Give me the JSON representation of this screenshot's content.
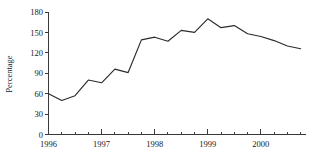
{
  "chart_data": {
    "type": "line",
    "title": "",
    "subtitle": "",
    "xlabel": "",
    "ylabel": "Percentage",
    "ylim": [
      0,
      180
    ],
    "yticks": [
      0,
      30,
      60,
      90,
      120,
      150,
      180
    ],
    "ytick_labels": [
      "0",
      "30",
      "60",
      "90",
      "120",
      "150",
      "180"
    ],
    "xlim": [
      1996.0,
      2000.85
    ],
    "xticks": [
      1996,
      1997,
      1998,
      1999,
      2000
    ],
    "xtick_labels": [
      "1996",
      "1997",
      "1998",
      "1999",
      "2000"
    ],
    "minor_xticks_per_year": 4,
    "grid": false,
    "legend": false,
    "legend_position": "none",
    "line_color": "#2b2b2b",
    "axis_color": "#3a3a3a",
    "background_color": "#ffffff",
    "series": [
      {
        "name": "Percentage",
        "x": [
          1996.0,
          1996.25,
          1996.5,
          1996.75,
          1997.0,
          1997.25,
          1997.5,
          1997.75,
          1998.0,
          1998.25,
          1998.5,
          1998.75,
          1999.0,
          1999.25,
          1999.5,
          1999.75,
          2000.0,
          2000.25,
          2000.5,
          2000.75
        ],
        "values": [
          60,
          50,
          57,
          80,
          76,
          96,
          91,
          139,
          143,
          137,
          153,
          150,
          170,
          157,
          160,
          148,
          144,
          138,
          130,
          126
        ]
      }
    ]
  }
}
